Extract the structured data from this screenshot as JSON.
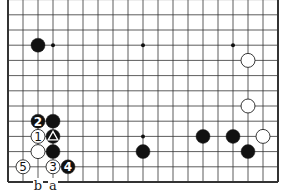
{
  "diagram": {
    "type": "go-board-partial",
    "board_size": 19,
    "visible_rows": "0-12 from bottom edge",
    "grid": {
      "x0": 8,
      "dx": 15,
      "y0": 182,
      "dy": 15.2,
      "cols": 19,
      "rows_visible": 13,
      "left_edge": true,
      "right_edge": true,
      "bottom_edge": true
    },
    "hoshi": [
      [
        3,
        3
      ],
      [
        9,
        3
      ],
      [
        15,
        3
      ],
      [
        3,
        9
      ],
      [
        9,
        9
      ],
      [
        15,
        9
      ]
    ],
    "stones": [
      {
        "color": "black",
        "col": 2,
        "row": 9,
        "label": ""
      },
      {
        "color": "white",
        "col": 16,
        "row": 8,
        "label": ""
      },
      {
        "color": "white",
        "col": 16,
        "row": 5,
        "label": ""
      },
      {
        "color": "white",
        "col": 17,
        "row": 3,
        "label": ""
      },
      {
        "color": "black",
        "col": 13,
        "row": 3,
        "label": ""
      },
      {
        "color": "black",
        "col": 15,
        "row": 3,
        "label": ""
      },
      {
        "color": "black",
        "col": 16,
        "row": 2,
        "label": ""
      },
      {
        "color": "black",
        "col": 9,
        "row": 2,
        "label": ""
      },
      {
        "color": "black",
        "col": 2,
        "row": 4,
        "label": "2"
      },
      {
        "color": "black",
        "col": 3,
        "row": 4,
        "label": ""
      },
      {
        "color": "white",
        "col": 2,
        "row": 3,
        "label": "1"
      },
      {
        "color": "black",
        "col": 3,
        "row": 3,
        "label": "triangle"
      },
      {
        "color": "white",
        "col": 2,
        "row": 2,
        "label": ""
      },
      {
        "color": "black",
        "col": 3,
        "row": 2,
        "label": ""
      },
      {
        "color": "white",
        "col": 1,
        "row": 1,
        "label": "5"
      },
      {
        "color": "white",
        "col": 3,
        "row": 1,
        "label": "3"
      },
      {
        "color": "black",
        "col": 4,
        "row": 1,
        "label": "4"
      }
    ],
    "point_labels": [
      {
        "col": 2,
        "row": 0,
        "text": "b"
      },
      {
        "col": 3,
        "row": 0,
        "text": "a"
      }
    ]
  }
}
